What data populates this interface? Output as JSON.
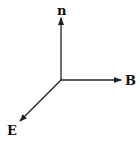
{
  "diagram": {
    "type": "3d-axes",
    "color": "#222222",
    "axes": [
      {
        "id": "n",
        "label": "n",
        "direction": "up"
      },
      {
        "id": "B",
        "label": "B",
        "direction": "right"
      },
      {
        "id": "E",
        "label": "E",
        "direction": "down-left"
      }
    ]
  }
}
